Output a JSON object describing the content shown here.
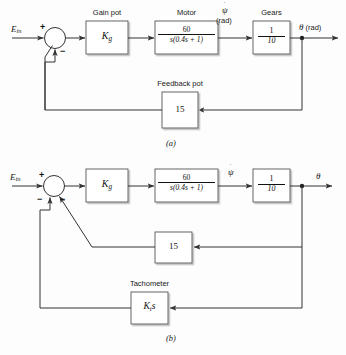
{
  "figure": {
    "type": "control-system-block-diagram",
    "background_color": "#fdfdfd",
    "line_color": "#333333",
    "box_fill": "#ffffff",
    "shadow_color": "#c8c8c8"
  },
  "diagram_a": {
    "caption": "(a)",
    "input_label": "E",
    "input_subscript": "in",
    "summing_junction": {
      "name": "summing-junction-a",
      "plus_sign": "+",
      "minus_sign": "−"
    },
    "blocks": [
      {
        "id": "gain-pot",
        "title": "Gain pot",
        "body": "K",
        "body_subscript": "g"
      },
      {
        "id": "motor",
        "title": "Motor",
        "numerator": "60",
        "denominator": "s(0.4s + 1)"
      },
      {
        "id": "gears",
        "title": "Gears",
        "numerator": "1",
        "denominator": "10"
      },
      {
        "id": "feedback-pot",
        "title": "Feedback pot",
        "body": "15"
      }
    ],
    "signals": [
      {
        "id": "psi-dot",
        "symbol": "ψ",
        "unit": "(rad)"
      },
      {
        "id": "theta-out",
        "symbol": "θ",
        "unit": "(rad)"
      }
    ]
  },
  "diagram_b": {
    "caption": "(b)",
    "input_label": "E",
    "input_subscript": "in",
    "summing_junction": {
      "name": "summing-junction-b",
      "plus_sign": "+",
      "minus_sign_1": "−",
      "minus_sign_2": "−"
    },
    "blocks": [
      {
        "id": "gain-pot",
        "title": "",
        "body": "K",
        "body_subscript": "g"
      },
      {
        "id": "motor",
        "title": "",
        "numerator": "60",
        "denominator": "s(0.4s + 1)"
      },
      {
        "id": "gears",
        "title": "",
        "numerator": "1",
        "denominator": "10"
      },
      {
        "id": "feedback-pot",
        "title": "",
        "body": "15"
      },
      {
        "id": "tachometer",
        "title": "Tachometer",
        "body": "K",
        "body_subscript": "t",
        "body_suffix": "s"
      }
    ],
    "signals": [
      {
        "id": "psi-dot",
        "symbol": "ψ",
        "unit": ""
      },
      {
        "id": "theta-out",
        "symbol": "θ",
        "unit": ""
      }
    ]
  }
}
